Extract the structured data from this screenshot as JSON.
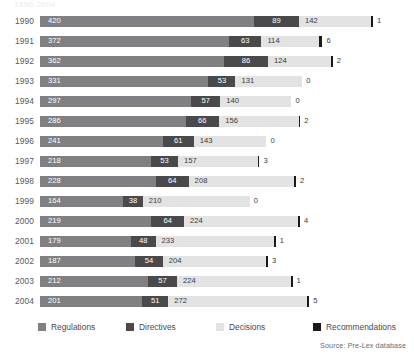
{
  "title_faint": "1990-2004",
  "legend": {
    "items": [
      {
        "label": "Regulations",
        "color": "#808082"
      },
      {
        "label": "Directives",
        "color": "#4a4a4c"
      },
      {
        "label": "Decisions",
        "color": "#e3e3e3"
      },
      {
        "label": "Recommendations",
        "color": "#1a1a1a"
      }
    ]
  },
  "source": "Source: Pre-Lex database",
  "chart_data": {
    "type": "bar",
    "orientation": "horizontal",
    "stacked": true,
    "title": "",
    "xlabel": "",
    "ylabel": "",
    "grid": false,
    "legend_position": "bottom",
    "categories": [
      "1990",
      "1991",
      "1992",
      "1993",
      "1994",
      "1995",
      "1996",
      "1997",
      "1998",
      "1999",
      "2000",
      "2001",
      "2002",
      "2003",
      "2004"
    ],
    "series": [
      {
        "name": "Regulations",
        "color": "#808082",
        "values": [
          420,
          372,
          362,
          331,
          297,
          286,
          241,
          218,
          228,
          164,
          219,
          179,
          187,
          212,
          201
        ]
      },
      {
        "name": "Directives",
        "color": "#4a4a4c",
        "values": [
          89,
          63,
          86,
          53,
          57,
          66,
          61,
          53,
          64,
          38,
          64,
          48,
          54,
          57,
          51
        ]
      },
      {
        "name": "Decisions",
        "color": "#e3e3e3",
        "values": [
          142,
          114,
          124,
          131,
          140,
          156,
          143,
          157,
          208,
          210,
          224,
          233,
          204,
          224,
          272
        ]
      },
      {
        "name": "Recommendations",
        "color": "#1a1a1a",
        "values": [
          1,
          6,
          2,
          0,
          0,
          2,
          0,
          3,
          2,
          0,
          4,
          1,
          3,
          1,
          5
        ]
      }
    ],
    "totals": [
      652,
      555,
      574,
      515,
      494,
      510,
      445,
      431,
      502,
      412,
      511,
      461,
      448,
      494,
      529
    ],
    "xlim": [
      0,
      652
    ],
    "px_per_unit": 0.509
  }
}
